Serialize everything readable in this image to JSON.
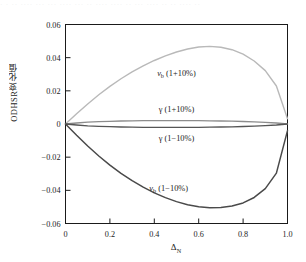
{
  "figure": {
    "top_cropped_text": "· ·  ·· ···· ··· ··· ···· ··· ·· ···· ···· ·· ··· ···· ·· ·· ···· ··",
    "background": "#ffffff",
    "frame_color": "#1a1a1a"
  },
  "chart_data": {
    "type": "line",
    "title": "",
    "xlabel": "Δ",
    "xlabel_sub": "N",
    "ylabel": "ODHSR变化值",
    "xlim": [
      0,
      1.0
    ],
    "ylim": [
      -0.06,
      0.06
    ],
    "grid": false,
    "legend": "inline-annotations",
    "xticks": [
      "0",
      "0.2",
      "0.4",
      "0.6",
      "0.8",
      "1.0"
    ],
    "xtick_values": [
      0,
      0.2,
      0.4,
      0.6,
      0.8,
      1.0
    ],
    "yticks": [
      "0.06",
      "0.04",
      "0.02",
      "0",
      "-0.02",
      "-0.04",
      "-0.06"
    ],
    "ytick_values": [
      0.06,
      0.04,
      0.02,
      0,
      -0.02,
      -0.04,
      -0.06
    ],
    "x": [
      0,
      0.05,
      0.1,
      0.15,
      0.2,
      0.25,
      0.3,
      0.35,
      0.4,
      0.45,
      0.5,
      0.55,
      0.6,
      0.65,
      0.7,
      0.75,
      0.8,
      0.85,
      0.9,
      0.95,
      1.0
    ],
    "series": [
      {
        "name": "v_b (1+10%)",
        "label": "v",
        "label_sub": "b",
        "label_tail": " (1+10%)",
        "color": "#b9b9b9",
        "width": 1.4,
        "peak_x": 0.62,
        "peak_y": 0.0468,
        "values": [
          0.0,
          0.0062,
          0.0121,
          0.0176,
          0.0227,
          0.0273,
          0.0314,
          0.0351,
          0.0383,
          0.0411,
          0.0434,
          0.0452,
          0.0464,
          0.0468,
          0.0463,
          0.0448,
          0.0421,
          0.038,
          0.0322,
          0.0229,
          0.0032
        ],
        "annotation": {
          "text": "v_b (1+10%)",
          "x": 0.5,
          "y": 0.0305
        }
      },
      {
        "name": "γ (1+10%)",
        "label": "γ",
        "label_tail": " (1+10%)",
        "color": "#8c8c8c",
        "width": 1.3,
        "values": [
          0.0,
          0.0006,
          0.0011,
          0.0014,
          0.0016,
          0.0018,
          0.0019,
          0.002,
          0.002,
          0.002,
          0.002,
          0.002,
          0.002,
          0.0019,
          0.0018,
          0.0017,
          0.0015,
          0.0013,
          0.001,
          0.0006,
          0.0
        ],
        "annotation": {
          "text": "γ (1+10%)",
          "x": 0.5,
          "y": 0.0092
        }
      },
      {
        "name": "γ (1-10%)",
        "label": "γ",
        "label_tail": " (1−10%)",
        "color": "#555555",
        "width": 1.3,
        "values": [
          0.0,
          -0.0006,
          -0.0011,
          -0.0014,
          -0.0016,
          -0.0018,
          -0.0019,
          -0.002,
          -0.002,
          -0.002,
          -0.002,
          -0.002,
          -0.002,
          -0.0019,
          -0.0018,
          -0.0017,
          -0.0015,
          -0.0013,
          -0.001,
          -0.0006,
          0.0
        ],
        "annotation": {
          "text": "γ (1−10%)",
          "x": 0.5,
          "y": -0.0087
        }
      },
      {
        "name": "v_b (1-10%)",
        "label": "v",
        "label_sub": "b",
        "label_tail": " (1−10%)",
        "color": "#4a4a4a",
        "width": 1.5,
        "peak_x": 0.65,
        "peak_y": -0.0505,
        "values": [
          0.0,
          -0.0068,
          -0.0133,
          -0.0193,
          -0.0248,
          -0.0298,
          -0.0342,
          -0.0381,
          -0.0415,
          -0.0444,
          -0.0468,
          -0.0487,
          -0.0499,
          -0.0505,
          -0.0504,
          -0.0495,
          -0.0476,
          -0.0443,
          -0.039,
          -0.0296,
          -0.004
        ],
        "annotation": {
          "text": "v_b (1−10%)",
          "x": 0.465,
          "y": -0.0385
        }
      }
    ]
  }
}
